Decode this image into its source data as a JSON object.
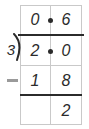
{
  "figure": {
    "type": "long-division"
  },
  "divisor": "3",
  "operator": "−",
  "quotient": {
    "ones": "0",
    "decimal_point": ".",
    "tenths": "6"
  },
  "dividend": {
    "ones": "2",
    "decimal_point": ".",
    "tenths": "0"
  },
  "subtrahend": {
    "ones": "1",
    "tenths": "8"
  },
  "remainder": {
    "ones": "",
    "tenths": "2"
  },
  "colors": {
    "ink": "#2b2b2b",
    "grid": "#c9c9c9",
    "operator": "#9a9a9a",
    "background": "#ffffff"
  }
}
